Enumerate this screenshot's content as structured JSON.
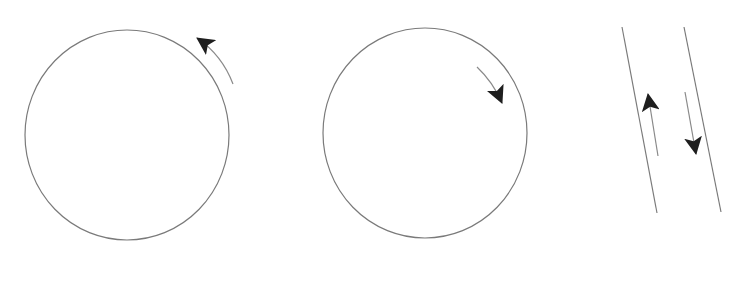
{
  "diagram": {
    "width": 742,
    "height": 284,
    "colors": {
      "background": "#ffffff",
      "outline": "#7a7a7a",
      "arrow_line": "#8a8a8a",
      "arrowhead": "#1e1e1e"
    },
    "panels": [
      {
        "id": "circle-counterclockwise",
        "shape": "circle",
        "center": [
          127,
          135
        ],
        "rx": 102,
        "ry": 105,
        "arrow": {
          "position": "outside-top-right",
          "direction": "counterclockwise",
          "tail": [
            233,
            84
          ],
          "tip": [
            195,
            36
          ]
        }
      },
      {
        "id": "circle-clockwise",
        "shape": "circle",
        "center": [
          425,
          133
        ],
        "rx": 102,
        "ry": 105,
        "arrow": {
          "position": "inside-top-right",
          "direction": "clockwise",
          "tail": [
            477,
            67
          ],
          "tip": [
            503,
            105
          ]
        }
      },
      {
        "id": "parallel-lines",
        "shape": "two-parallel-slanted-lines",
        "lines": [
          {
            "from": [
              622,
              27
            ],
            "to": [
              657,
              213
            ]
          },
          {
            "from": [
              684,
              27
            ],
            "to": [
              721,
              212
            ]
          }
        ],
        "arrows": [
          {
            "direction": "up",
            "tail": [
              658,
              156
            ],
            "tip": [
              647,
              92
            ]
          },
          {
            "direction": "down",
            "tail": [
              685,
              92
            ],
            "tip": [
              696,
              156
            ]
          }
        ]
      }
    ]
  }
}
